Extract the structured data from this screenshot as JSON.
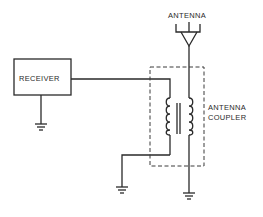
{
  "diagram": {
    "type": "circuit schematic",
    "labels": {
      "antenna": "ANTENNA",
      "receiver": "RECEIVER",
      "coupler_line1": "ANTENNA",
      "coupler_line2": "COUPLER"
    },
    "components": [
      {
        "name": "antenna",
        "kind": "antenna-symbol"
      },
      {
        "name": "receiver",
        "kind": "box"
      },
      {
        "name": "antenna-coupler",
        "kind": "dashed-enclosure",
        "contains": "transformer"
      },
      {
        "name": "ground-receiver",
        "kind": "ground"
      },
      {
        "name": "ground-primary",
        "kind": "ground"
      },
      {
        "name": "ground-secondary",
        "kind": "ground"
      }
    ],
    "connections": [
      "receiver output -> transformer primary top",
      "transformer primary bottom -> ground",
      "antenna -> transformer secondary -> ground",
      "receiver -> ground"
    ]
  }
}
